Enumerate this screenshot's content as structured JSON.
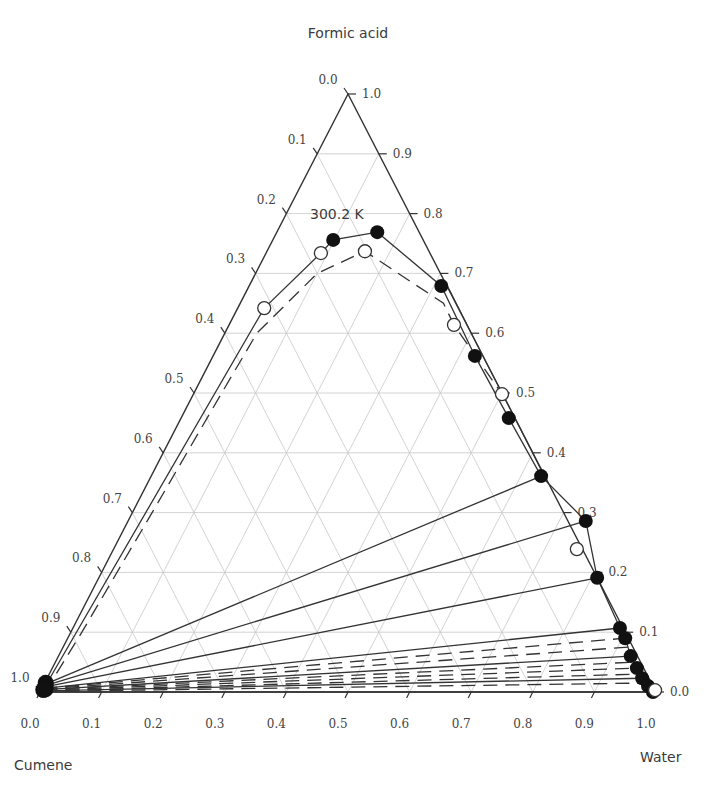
{
  "chart_data": {
    "type": "ternary",
    "title": "300.2 K",
    "vertices": {
      "top": "Formic acid",
      "left": "Cumene",
      "right": "Water"
    },
    "axes": {
      "bottom_ticks": [
        "0.0",
        "0.1",
        "0.2",
        "0.3",
        "0.4",
        "0.5",
        "0.6",
        "0.7",
        "0.8",
        "0.9",
        "1.0"
      ],
      "left_ticks": [
        "0.0",
        "0.1",
        "0.2",
        "0.3",
        "0.4",
        "0.5",
        "0.6",
        "0.7",
        "0.8",
        "0.9",
        "1.0"
      ],
      "right_ticks": [
        "1.0",
        "0.9",
        "0.8",
        "0.7",
        "0.6",
        "0.5",
        "0.4",
        "0.3",
        "0.2",
        "0.1",
        "0.0"
      ],
      "grid": true
    },
    "colors": {
      "line": "#333333",
      "grid": "#c8c8c8",
      "filled": "#111111",
      "open": "#ffffff"
    },
    "series": [
      {
        "name": "Experimental binodal (filled)",
        "marker": "filled-circle",
        "points_formic_water": [
          [
            0.756,
            0.098
          ],
          [
            0.769,
            0.163
          ],
          [
            0.679,
            0.312
          ],
          [
            0.562,
            0.425
          ],
          [
            0.458,
            0.532
          ],
          [
            0.361,
            0.633
          ],
          [
            0.286,
            0.743
          ],
          [
            0.191,
            0.809
          ],
          [
            0.107,
            0.888
          ],
          [
            0.09,
            0.905
          ],
          [
            0.06,
            0.929
          ],
          [
            0.04,
            0.949
          ],
          [
            0.023,
            0.966
          ],
          [
            0.01,
            0.982
          ],
          [
            0.0,
            0.995
          ]
        ],
        "cumene_rich_points": [
          [
            0.012,
            0.0
          ],
          [
            0.008,
            0.002
          ],
          [
            0.005,
            0.003
          ],
          [
            0.003,
            0.004
          ],
          [
            0.001,
            0.005
          ],
          [
            0.0,
            0.002
          ]
        ]
      },
      {
        "name": "Calculated binodal (open)",
        "marker": "open-circle",
        "points_formic_water": [
          [
            0.642,
            0.043
          ],
          [
            0.734,
            0.089
          ],
          [
            0.737,
            0.159
          ],
          [
            0.614,
            0.365
          ],
          [
            0.498,
            0.501
          ],
          [
            0.239,
            0.752
          ],
          [
            0.003,
            0.997
          ]
        ]
      }
    ],
    "tie_lines_experimental": [
      [
        [
          0.012,
          0.0
        ],
        [
          0.361,
          0.633
        ]
      ],
      [
        [
          0.01,
          0.001
        ],
        [
          0.286,
          0.743
        ]
      ],
      [
        [
          0.008,
          0.002
        ],
        [
          0.191,
          0.809
        ]
      ],
      [
        [
          0.006,
          0.003
        ],
        [
          0.107,
          0.888
        ]
      ],
      [
        [
          0.004,
          0.004
        ],
        [
          0.06,
          0.929
        ]
      ],
      [
        [
          0.002,
          0.005
        ],
        [
          0.023,
          0.966
        ]
      ],
      [
        [
          0.0,
          0.006
        ],
        [
          0.0,
          0.995
        ]
      ]
    ],
    "tie_lines_calculated": [
      [
        [
          0.006,
          0.002
        ],
        [
          0.09,
          0.905
        ]
      ],
      [
        [
          0.005,
          0.003
        ],
        [
          0.075,
          0.918
        ]
      ],
      [
        [
          0.004,
          0.004
        ],
        [
          0.05,
          0.94
        ]
      ],
      [
        [
          0.003,
          0.004
        ],
        [
          0.04,
          0.949
        ]
      ],
      [
        [
          0.002,
          0.005
        ],
        [
          0.03,
          0.958
        ]
      ],
      [
        [
          0.001,
          0.005
        ],
        [
          0.015,
          0.975
        ]
      ]
    ],
    "left_branch_experimental": [
      [
        0.0,
        0.0
      ],
      [
        0.642,
        0.043
      ]
    ],
    "left_branch_calculated": [
      [
        0.0,
        0.003
      ],
      [
        0.6,
        0.05
      ]
    ]
  }
}
